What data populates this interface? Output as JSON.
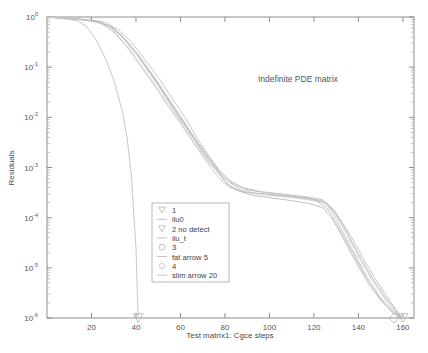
{
  "chart_data": {
    "type": "line",
    "title": "",
    "annotation": "Indefinite PDE matrix",
    "xlabel": "Test matrix1: Cgce steps",
    "ylabel": "Residuals",
    "xlim": [
      0,
      165
    ],
    "ylim_log10": [
      -6,
      0
    ],
    "xticks": [
      20,
      40,
      60,
      80,
      100,
      120,
      140,
      160
    ],
    "xtick_labels": [
      "20",
      "40",
      "60",
      "80",
      "100",
      "120",
      "140",
      "160"
    ],
    "yticks_log10": [
      0,
      -1,
      -2,
      -3,
      -4,
      -5,
      -6
    ],
    "ytick_labels": [
      "10",
      "10",
      "10",
      "10",
      "10",
      "10",
      "10"
    ],
    "ytick_exponents": [
      "0",
      "-1",
      "-2",
      "-3",
      "-4",
      "-5",
      "-6"
    ],
    "grid": false,
    "legend_position": "center-left-lower",
    "series": [
      {
        "name": "1",
        "marker": "triangle-down",
        "color": "#b9b9b9",
        "points": [
          [
            0,
            0
          ],
          [
            5,
            -0.02
          ],
          [
            10,
            -0.05
          ],
          [
            14,
            -0.08
          ],
          [
            18,
            -0.2
          ],
          [
            22,
            -0.45
          ],
          [
            26,
            -0.8
          ],
          [
            30,
            -1.25
          ],
          [
            34,
            -1.9
          ],
          [
            36,
            -2.4
          ],
          [
            38,
            -3.2
          ],
          [
            40,
            -4.6
          ],
          [
            41,
            -6.0
          ]
        ]
      },
      {
        "name": "ilu0",
        "marker": "line",
        "color": "#bdbdbd",
        "points": [
          [
            0,
            0
          ],
          [
            10,
            -0.03
          ],
          [
            20,
            -0.06
          ],
          [
            26,
            -0.1
          ],
          [
            32,
            -0.25
          ],
          [
            38,
            -0.5
          ],
          [
            44,
            -0.85
          ],
          [
            50,
            -1.2
          ],
          [
            56,
            -1.6
          ],
          [
            62,
            -2.0
          ],
          [
            68,
            -2.45
          ],
          [
            74,
            -2.85
          ],
          [
            78,
            -3.15
          ],
          [
            82,
            -3.38
          ],
          [
            88,
            -3.48
          ],
          [
            96,
            -3.52
          ],
          [
            106,
            -3.56
          ],
          [
            116,
            -3.6
          ],
          [
            124,
            -3.66
          ],
          [
            128,
            -3.85
          ],
          [
            132,
            -4.2
          ],
          [
            138,
            -4.7
          ],
          [
            144,
            -5.2
          ],
          [
            150,
            -5.6
          ],
          [
            155,
            -5.85
          ],
          [
            159,
            -5.98
          ],
          [
            160,
            -6.0
          ]
        ]
      },
      {
        "name": "2 no detect",
        "marker": "triangle-down",
        "color": "#b0b0b0",
        "points": [
          [
            0,
            0
          ],
          [
            12,
            -0.03
          ],
          [
            22,
            -0.08
          ],
          [
            28,
            -0.18
          ],
          [
            34,
            -0.4
          ],
          [
            40,
            -0.72
          ],
          [
            46,
            -1.1
          ],
          [
            52,
            -1.5
          ],
          [
            58,
            -1.92
          ],
          [
            64,
            -2.3
          ],
          [
            70,
            -2.7
          ],
          [
            76,
            -3.05
          ],
          [
            80,
            -3.28
          ],
          [
            85,
            -3.45
          ],
          [
            92,
            -3.55
          ],
          [
            100,
            -3.6
          ],
          [
            110,
            -3.66
          ],
          [
            118,
            -3.72
          ],
          [
            124,
            -3.8
          ],
          [
            128,
            -4.0
          ],
          [
            133,
            -4.4
          ],
          [
            139,
            -4.9
          ],
          [
            145,
            -5.35
          ],
          [
            151,
            -5.7
          ],
          [
            156,
            -5.92
          ],
          [
            159,
            -6.0
          ]
        ]
      },
      {
        "name": "ilu_t",
        "marker": "line",
        "color": "#c2c2c2",
        "points": [
          [
            0,
            0
          ],
          [
            8,
            -0.02
          ],
          [
            16,
            -0.05
          ],
          [
            24,
            -0.12
          ],
          [
            30,
            -0.3
          ],
          [
            36,
            -0.6
          ],
          [
            42,
            -0.98
          ],
          [
            48,
            -1.35
          ],
          [
            54,
            -1.75
          ],
          [
            60,
            -2.12
          ],
          [
            66,
            -2.52
          ],
          [
            72,
            -2.9
          ],
          [
            77,
            -3.2
          ],
          [
            82,
            -3.4
          ],
          [
            90,
            -3.5
          ],
          [
            98,
            -3.54
          ],
          [
            108,
            -3.58
          ],
          [
            118,
            -3.63
          ],
          [
            125,
            -3.7
          ],
          [
            130,
            -3.95
          ],
          [
            135,
            -4.35
          ],
          [
            141,
            -4.85
          ],
          [
            147,
            -5.3
          ],
          [
            153,
            -5.68
          ],
          [
            157,
            -5.9
          ],
          [
            160,
            -6.0
          ]
        ]
      },
      {
        "name": "3",
        "marker": "circle",
        "color": "#b6b6b6",
        "points": [
          [
            0,
            0
          ],
          [
            14,
            -0.04
          ],
          [
            24,
            -0.1
          ],
          [
            30,
            -0.22
          ],
          [
            36,
            -0.48
          ],
          [
            42,
            -0.82
          ],
          [
            48,
            -1.18
          ],
          [
            54,
            -1.58
          ],
          [
            60,
            -1.98
          ],
          [
            66,
            -2.38
          ],
          [
            72,
            -2.75
          ],
          [
            78,
            -3.08
          ],
          [
            83,
            -3.3
          ],
          [
            90,
            -3.44
          ],
          [
            98,
            -3.5
          ],
          [
            108,
            -3.55
          ],
          [
            118,
            -3.61
          ],
          [
            126,
            -3.72
          ],
          [
            130,
            -3.92
          ],
          [
            136,
            -4.32
          ],
          [
            142,
            -4.8
          ],
          [
            148,
            -5.25
          ],
          [
            154,
            -5.65
          ],
          [
            158,
            -5.9
          ],
          [
            160,
            -6.0
          ]
        ]
      },
      {
        "name": "fat arrow 5",
        "marker": "line",
        "color": "#c6c6c6",
        "points": [
          [
            0,
            0
          ],
          [
            10,
            -0.03
          ],
          [
            20,
            -0.07
          ],
          [
            27,
            -0.16
          ],
          [
            33,
            -0.36
          ],
          [
            39,
            -0.66
          ],
          [
            45,
            -1.04
          ],
          [
            51,
            -1.42
          ],
          [
            57,
            -1.84
          ],
          [
            63,
            -2.22
          ],
          [
            69,
            -2.62
          ],
          [
            75,
            -2.98
          ],
          [
            80,
            -3.22
          ],
          [
            86,
            -3.42
          ],
          [
            94,
            -3.52
          ],
          [
            104,
            -3.57
          ],
          [
            114,
            -3.62
          ],
          [
            122,
            -3.68
          ],
          [
            127,
            -3.88
          ],
          [
            132,
            -4.26
          ],
          [
            138,
            -4.75
          ],
          [
            144,
            -5.22
          ],
          [
            150,
            -5.62
          ],
          [
            156,
            -5.88
          ],
          [
            160,
            -6.0
          ]
        ]
      },
      {
        "name": "4",
        "marker": "diamond",
        "color": "#bababa",
        "points": [
          [
            0,
            0
          ],
          [
            12,
            -0.04
          ],
          [
            22,
            -0.09
          ],
          [
            29,
            -0.2
          ],
          [
            35,
            -0.44
          ],
          [
            41,
            -0.76
          ],
          [
            47,
            -1.14
          ],
          [
            53,
            -1.54
          ],
          [
            59,
            -1.94
          ],
          [
            65,
            -2.34
          ],
          [
            71,
            -2.72
          ],
          [
            77,
            -3.05
          ],
          [
            82,
            -3.26
          ],
          [
            88,
            -3.4
          ],
          [
            96,
            -3.48
          ],
          [
            106,
            -3.53
          ],
          [
            116,
            -3.58
          ],
          [
            124,
            -3.64
          ],
          [
            129,
            -3.84
          ],
          [
            134,
            -4.22
          ],
          [
            140,
            -4.72
          ],
          [
            146,
            -5.18
          ],
          [
            152,
            -5.58
          ],
          [
            157,
            -5.86
          ],
          [
            159,
            -6.0
          ]
        ]
      },
      {
        "name": "slim arrow 20",
        "marker": "line",
        "color": "#c9c9c9",
        "points": [
          [
            0,
            0
          ],
          [
            9,
            -0.02
          ],
          [
            18,
            -0.06
          ],
          [
            25,
            -0.14
          ],
          [
            31,
            -0.33
          ],
          [
            37,
            -0.62
          ],
          [
            43,
            -1.0
          ],
          [
            49,
            -1.38
          ],
          [
            55,
            -1.78
          ],
          [
            61,
            -2.16
          ],
          [
            67,
            -2.56
          ],
          [
            73,
            -2.92
          ],
          [
            79,
            -3.18
          ],
          [
            84,
            -3.36
          ],
          [
            92,
            -3.46
          ],
          [
            102,
            -3.52
          ],
          [
            112,
            -3.57
          ],
          [
            120,
            -3.64
          ],
          [
            126,
            -3.8
          ],
          [
            131,
            -4.18
          ],
          [
            137,
            -4.68
          ],
          [
            143,
            -5.15
          ],
          [
            149,
            -5.55
          ],
          [
            155,
            -5.84
          ],
          [
            160,
            -6.0
          ]
        ]
      }
    ],
    "endpoint_markers": [
      {
        "series": "1",
        "x": 41,
        "y_log10": -6,
        "shape": "triangle-down"
      },
      {
        "series": "4",
        "x": 156,
        "y_log10": -6,
        "shape": "diamond"
      },
      {
        "series": "2 no detect",
        "x": 160,
        "y_log10": -6,
        "shape": "triangle-down"
      }
    ]
  },
  "legend": {
    "entries": [
      {
        "label": "1",
        "marker": "triangle-down"
      },
      {
        "label": "ilu0",
        "marker": "line"
      },
      {
        "label": "2 no detect",
        "marker": "triangle-down"
      },
      {
        "label": "ilu_t",
        "marker": "line"
      },
      {
        "label": "3",
        "marker": "circle"
      },
      {
        "label": "fat arrow 5",
        "marker": "line"
      },
      {
        "label": "4",
        "marker": "diamond"
      },
      {
        "label": "slim arrow 20",
        "marker": "line"
      }
    ]
  },
  "colors": {
    "axis": "#8e8e8e",
    "text": "#4a4a4a",
    "curve": "#b8b8b8",
    "background": "#ffffff"
  }
}
